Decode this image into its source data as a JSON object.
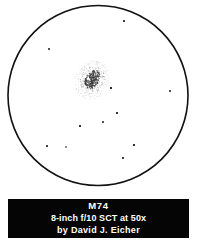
{
  "figure": {
    "kind": "astronomical-eyepiece-sketch",
    "background_color": "#ffffff",
    "ink_color": "#000000"
  },
  "field_of_view": {
    "shape": "circle",
    "center_x": 98,
    "center_y": 95.5,
    "radius": 90,
    "stroke_width": 1.6,
    "stroke_color": "#111111",
    "fill_color": "#ffffff"
  },
  "deep_sky_object": {
    "designation": "M74",
    "appearance": "faint diffuse stippled oval with brighter elongated core",
    "center_x": 92,
    "center_y": 80,
    "halo_rx": 17,
    "halo_ry": 20,
    "core_rx": 6.5,
    "core_ry": 11,
    "core_rotation_deg": 28,
    "stipple_seed": 74,
    "stipple_count": 430,
    "halo_color": "#9a9a9a",
    "core_color": "#3c3c3c"
  },
  "field_stars": [
    {
      "x": 124,
      "y": 21,
      "r": 1.0
    },
    {
      "x": 49,
      "y": 49,
      "r": 0.9
    },
    {
      "x": 111,
      "y": 88,
      "r": 1.1
    },
    {
      "x": 170,
      "y": 91,
      "r": 0.9
    },
    {
      "x": 117,
      "y": 113,
      "r": 1.1
    },
    {
      "x": 103,
      "y": 122,
      "r": 0.9
    },
    {
      "x": 80,
      "y": 126,
      "r": 1.1
    },
    {
      "x": 47,
      "y": 146,
      "r": 1.0
    },
    {
      "x": 66,
      "y": 147,
      "r": 0.8
    },
    {
      "x": 134,
      "y": 145,
      "r": 1.1
    },
    {
      "x": 123,
      "y": 158,
      "r": 1.0
    }
  ],
  "caption": {
    "background_color": "#050505",
    "text_color": "#ffffff",
    "title": "M74",
    "instrument": "8-inch f/10 SCT at 50x",
    "observer": "by David J. Eicher"
  }
}
